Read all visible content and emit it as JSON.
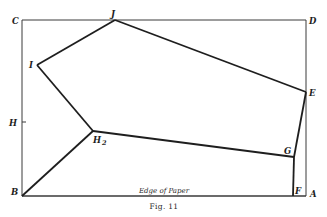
{
  "figure": {
    "caption": "Fig. 11",
    "edge_label": "Edge of Paper",
    "frame": {
      "C": [
        22,
        20
      ],
      "D": [
        306,
        20
      ],
      "A": [
        306,
        196
      ],
      "B": [
        22,
        196
      ]
    },
    "polygon_points": {
      "J": [
        115,
        20
      ],
      "E": [
        306,
        92
      ],
      "G": [
        294,
        157
      ],
      "F": [
        293,
        196
      ],
      "H2": [
        93,
        131
      ],
      "I": [
        37,
        65
      ],
      "B": [
        22,
        196
      ]
    },
    "labels": {
      "C": "C",
      "J": "J",
      "D": "D",
      "I": "I",
      "E": "E",
      "H": "H",
      "H2_main": "H",
      "H2_sub": "2",
      "G": "G",
      "B": "B",
      "F": "F",
      "A": "A"
    },
    "colors": {
      "line": "#1e1e1e",
      "frame": "#3a3a3a",
      "background": "#ffffff"
    }
  }
}
